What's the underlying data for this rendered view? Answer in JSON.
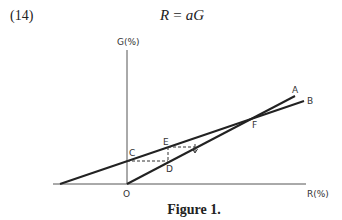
{
  "equation": {
    "number": "(14)",
    "lhs": "R",
    "op": "=",
    "rhs": "aG"
  },
  "diagram": {
    "axes": {
      "y_label": "G(%)",
      "x_label": "R(%)",
      "origin_label": "O"
    },
    "lines": [
      {
        "label": "A",
        "description": "line through origin O, steeper slope"
      },
      {
        "label": "B",
        "description": "line with positive G-intercept at C, shallower slope"
      }
    ],
    "points": {
      "C": "C",
      "D": "D",
      "E": "E",
      "F": "F"
    },
    "colors": {
      "line": "#222222",
      "axis": "#444444",
      "dashed": "#333333"
    }
  },
  "caption": "Figure 1."
}
